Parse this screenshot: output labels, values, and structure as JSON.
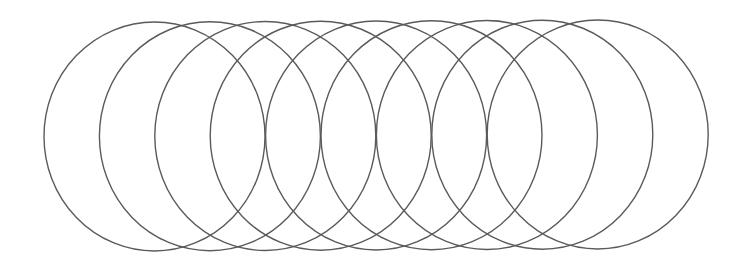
{
  "diagram": {
    "type": "overlapping-circles",
    "count": 9,
    "stroke_color": "#5a5a5a",
    "background_color": "#ffffff",
    "radius_x": 110.5,
    "radius_y": 114.5,
    "spacing": 55.4,
    "circles": [
      {
        "cx": 154.5,
        "cy": 136.5
      },
      {
        "cx": 209.9,
        "cy": 136.2
      },
      {
        "cx": 265.3,
        "cy": 136.0
      },
      {
        "cx": 320.7,
        "cy": 135.7
      },
      {
        "cx": 376.1,
        "cy": 135.5
      },
      {
        "cx": 431.5,
        "cy": 135.2
      },
      {
        "cx": 486.9,
        "cy": 135.0
      },
      {
        "cx": 542.3,
        "cy": 134.7
      },
      {
        "cx": 597.7,
        "cy": 134.5
      }
    ]
  }
}
